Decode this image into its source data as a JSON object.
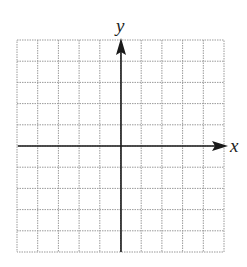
{
  "diagram": {
    "type": "coordinate-grid",
    "grid": {
      "columns": 10,
      "rows": 10,
      "left": 17,
      "top": 40,
      "right": 224,
      "bottom": 252,
      "line_color": "#9a9a9a",
      "line_style": "dotted"
    },
    "axes": {
      "x_label": "x",
      "y_label": "y",
      "origin_px": [
        121,
        146
      ],
      "axis_color": "#1a1a1a"
    }
  }
}
